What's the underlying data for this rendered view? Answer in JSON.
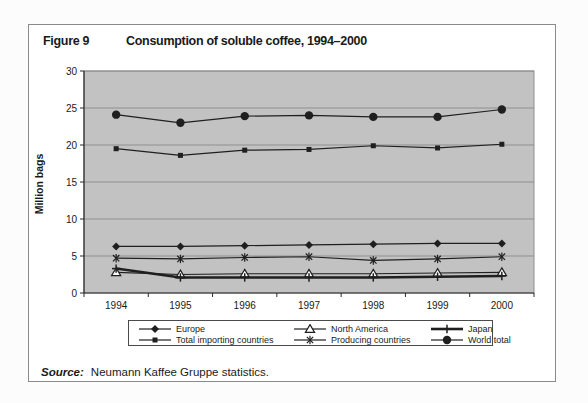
{
  "figure": {
    "label": "Figure 9",
    "title": "Consumption of soluble coffee, 1994–2000"
  },
  "source": {
    "label": "Source:",
    "text": "Neumann Kaffee Gruppe statistics."
  },
  "colors": {
    "plot_bg": "#c2c2c2",
    "gridline": "#8f8f8f",
    "axis": "#2a2a2a",
    "series": "#1f1f1f",
    "text": "#1a1a1a",
    "figure_border": "#8a8a8a",
    "legend_border": "#4a4a4a"
  },
  "chart_data": {
    "type": "line",
    "title": "Consumption of soluble coffee, 1994–2000",
    "xlabel": "",
    "ylabel": "Million bags",
    "ylim": [
      0,
      30
    ],
    "yticks": [
      0,
      5,
      10,
      15,
      20,
      25,
      30
    ],
    "grid": "horizontal",
    "plot_background": "gray",
    "legend_position": "bottom",
    "categories": [
      "1994",
      "1995",
      "1996",
      "1997",
      "1998",
      "1999",
      "2000"
    ],
    "series": [
      {
        "name": "Europe",
        "marker": "diamond-filled",
        "thick": false,
        "values": [
          6.3,
          6.3,
          6.4,
          6.5,
          6.6,
          6.7,
          6.7
        ]
      },
      {
        "name": "North America",
        "marker": "triangle-open",
        "thick": false,
        "values": [
          2.8,
          2.5,
          2.6,
          2.6,
          2.6,
          2.7,
          2.8
        ]
      },
      {
        "name": "Japan",
        "marker": "plus",
        "thick": true,
        "values": [
          3.3,
          2.1,
          2.1,
          2.1,
          2.1,
          2.2,
          2.3
        ]
      },
      {
        "name": "Total importing countries",
        "marker": "square-filled",
        "thick": false,
        "values": [
          19.5,
          18.6,
          19.3,
          19.4,
          19.9,
          19.6,
          20.1
        ]
      },
      {
        "name": "Producing countries",
        "marker": "asterisk",
        "thick": false,
        "values": [
          4.7,
          4.6,
          4.8,
          4.9,
          4.4,
          4.6,
          4.9
        ]
      },
      {
        "name": "World total",
        "marker": "circle-filled",
        "thick": false,
        "values": [
          24.1,
          23.0,
          23.9,
          24.0,
          23.8,
          23.8,
          24.8
        ]
      }
    ]
  }
}
